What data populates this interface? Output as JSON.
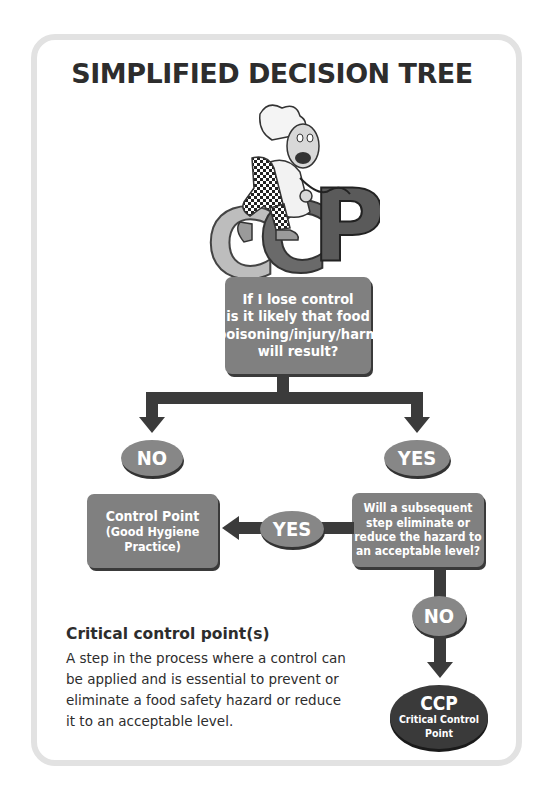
{
  "title": "SIMPLIFIED DECISION TREE",
  "mascot": {
    "description": "cartoon chef in checkered trousers riding the letters CCP",
    "letters": "CCP"
  },
  "question_1": {
    "lines": [
      "If I lose control",
      "is it likely that food",
      "poisoning/injury/harm",
      "will result?"
    ]
  },
  "branch_no": {
    "label": "NO"
  },
  "branch_yes": {
    "label": "YES"
  },
  "control_point": {
    "lines": [
      "Control Point",
      "(Good Hygiene",
      "Practice)"
    ]
  },
  "question_2": {
    "lines": [
      "Will a subsequent",
      "step eliminate or",
      "reduce the hazard to",
      "an acceptable level?"
    ]
  },
  "branch_yes_2": {
    "label": "YES"
  },
  "branch_no_2": {
    "label": "NO"
  },
  "ccp_result": {
    "abbr": "CCP",
    "lines": [
      "Critical Control",
      "Point"
    ]
  },
  "definition": {
    "heading": "Critical control point(s)",
    "lines": [
      "A step in the process where a control can",
      "be applied and is essential to prevent or",
      "eliminate a food safety hazard or reduce",
      "it to an acceptable level."
    ]
  },
  "colors": {
    "frame": "#e2e2e2",
    "box_fill": "#808080",
    "oval_fill": "#878787",
    "arrow": "#3b3b3b",
    "ccp_fill": "#3a3a3a",
    "text": "#2d2d2d"
  }
}
